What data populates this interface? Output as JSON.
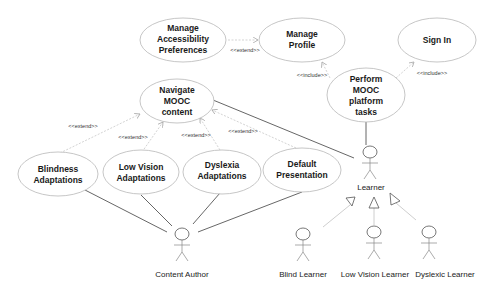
{
  "diagram": {
    "type": "uml-use-case",
    "use_cases": [
      {
        "id": "manage_accessibility",
        "lines": [
          "Manage",
          "Accessibility",
          "Preferences"
        ]
      },
      {
        "id": "manage_profile",
        "lines": [
          "Manage",
          "Profile"
        ]
      },
      {
        "id": "sign_in",
        "lines": [
          "Sign In"
        ]
      },
      {
        "id": "perform_mooc",
        "lines": [
          "Perform",
          "MOOC",
          "platform",
          "tasks"
        ]
      },
      {
        "id": "navigate_mooc",
        "lines": [
          "Navigate",
          "MOOC",
          "content"
        ]
      },
      {
        "id": "blindness",
        "lines": [
          "Blindness",
          "Adaptations"
        ]
      },
      {
        "id": "low_vision",
        "lines": [
          "Low Vision",
          "Adaptations"
        ]
      },
      {
        "id": "dyslexia",
        "lines": [
          "Dyslexia",
          "Adaptations"
        ]
      },
      {
        "id": "default_presentation",
        "lines": [
          "Default",
          "Presentation"
        ]
      }
    ],
    "actors": {
      "content_author": "Content Author",
      "learner": "Learner",
      "blind_learner": "Blind Learner",
      "low_vision_learner": "Low Vision Learner",
      "dyslexic_learner": "Dyslexic Learner"
    },
    "relations": {
      "extend": "<<extend>>",
      "include": "<<include>>"
    },
    "edges": [
      {
        "from": "manage_accessibility",
        "to": "manage_profile",
        "kind": "extend"
      },
      {
        "from": "perform_mooc",
        "to": "manage_profile",
        "kind": "include"
      },
      {
        "from": "perform_mooc",
        "to": "sign_in",
        "kind": "include"
      },
      {
        "from": "blindness",
        "to": "navigate_mooc",
        "kind": "extend"
      },
      {
        "from": "low_vision",
        "to": "navigate_mooc",
        "kind": "extend"
      },
      {
        "from": "dyslexia",
        "to": "navigate_mooc",
        "kind": "extend"
      },
      {
        "from": "default_presentation",
        "to": "navigate_mooc",
        "kind": "extend"
      },
      {
        "from": "learner",
        "to": "navigate_mooc",
        "kind": "association"
      },
      {
        "from": "learner",
        "to": "perform_mooc",
        "kind": "association"
      },
      {
        "from": "content_author",
        "to": "blindness",
        "kind": "association"
      },
      {
        "from": "content_author",
        "to": "low_vision",
        "kind": "association"
      },
      {
        "from": "content_author",
        "to": "dyslexia",
        "kind": "association"
      },
      {
        "from": "content_author",
        "to": "default_presentation",
        "kind": "association"
      },
      {
        "from": "blind_learner",
        "to": "learner",
        "kind": "generalization"
      },
      {
        "from": "low_vision_learner",
        "to": "learner",
        "kind": "generalization"
      },
      {
        "from": "dyslexic_learner",
        "to": "learner",
        "kind": "generalization"
      }
    ]
  }
}
